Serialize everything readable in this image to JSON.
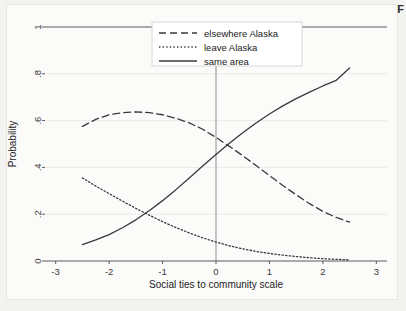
{
  "figure": {
    "caption_marker": "F"
  },
  "chart_data": {
    "type": "line",
    "title": "",
    "xlabel": "Social ties to community scale",
    "ylabel": "Probability",
    "xlim": [
      -3.2,
      3.2
    ],
    "ylim": [
      0,
      1
    ],
    "xticks": [
      -3,
      -2,
      -1,
      0,
      1,
      2,
      3
    ],
    "xticklabels": [
      "-3",
      "-2",
      "-1",
      "0",
      "1",
      "2",
      "3"
    ],
    "yticks": [
      0,
      0.2,
      0.4,
      0.6,
      0.8,
      1
    ],
    "yticklabels": [
      "0",
      ".2",
      ".4",
      ".6",
      ".8",
      "1"
    ],
    "grid": "horizontal",
    "legend_position": "top-center",
    "reference_lines": [
      {
        "name": "zero-vertical-line",
        "orientation": "vertical",
        "value": 0
      },
      {
        "name": "top-horizontal-line",
        "orientation": "horizontal",
        "value": 1
      },
      {
        "name": "bottom-axis-line",
        "orientation": "horizontal",
        "value": 0
      }
    ],
    "x": [
      -2.5,
      -2.25,
      -2,
      -1.75,
      -1.5,
      -1.25,
      -1,
      -0.75,
      -0.5,
      -0.25,
      0,
      0.25,
      0.5,
      0.75,
      1,
      1.25,
      1.5,
      1.75,
      2,
      2.25,
      2.5
    ],
    "series": [
      {
        "name": "elsewhere Alaska",
        "style": "dashed",
        "color": "#3a3a3a",
        "values": [
          0.575,
          0.605,
          0.625,
          0.634,
          0.637,
          0.634,
          0.625,
          0.61,
          0.59,
          0.563,
          0.528,
          0.49,
          0.45,
          0.408,
          0.365,
          0.323,
          0.283,
          0.245,
          0.212,
          0.186,
          0.166
        ]
      },
      {
        "name": "leave Alaska",
        "style": "dotted",
        "color": "#3a3a3a",
        "values": [
          0.355,
          0.32,
          0.288,
          0.256,
          0.225,
          0.196,
          0.168,
          0.143,
          0.12,
          0.099,
          0.081,
          0.065,
          0.052,
          0.041,
          0.032,
          0.025,
          0.019,
          0.014,
          0.01,
          0.007,
          0.005
        ]
      },
      {
        "name": "same area",
        "style": "solid",
        "color": "#3a3a3a",
        "values": [
          0.07,
          0.09,
          0.113,
          0.142,
          0.176,
          0.215,
          0.258,
          0.305,
          0.355,
          0.406,
          0.455,
          0.503,
          0.548,
          0.59,
          0.628,
          0.663,
          0.694,
          0.722,
          0.748,
          0.772,
          0.825
        ]
      }
    ],
    "legend_entries": [
      {
        "label": "elsewhere Alaska",
        "style": "dashed"
      },
      {
        "label": "leave Alaska",
        "style": "dotted"
      },
      {
        "label": "same area",
        "style": "solid"
      }
    ]
  }
}
